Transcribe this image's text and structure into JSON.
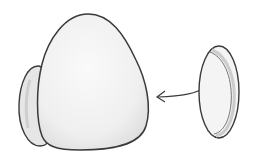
{
  "illustration": {
    "description": "Hand-drawn sketch of an egg-shaped body with a small disc attached on its left side, and a separate disc on the right with an arrow pointing toward the body",
    "colors": {
      "outline": "#3a3a3a",
      "fill": "#f2f2f2",
      "shade": "#d9d9d9",
      "background": "#ffffff"
    }
  }
}
